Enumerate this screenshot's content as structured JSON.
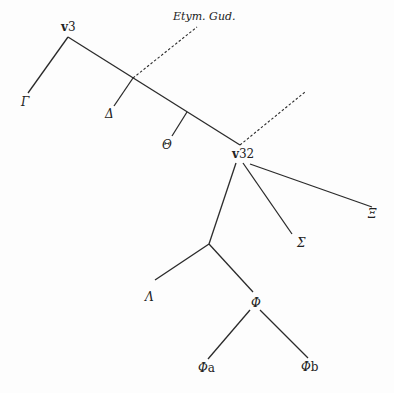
{
  "diagram": {
    "type": "stemma",
    "nodes": [
      {
        "id": "v3",
        "label_prefix": "v",
        "label_suffix": "3"
      },
      {
        "id": "Gamma",
        "label": "Γ"
      },
      {
        "id": "Delta",
        "label": "Δ"
      },
      {
        "id": "Theta",
        "label": "Θ"
      },
      {
        "id": "v32",
        "label_prefix": "v",
        "label_suffix": "32"
      },
      {
        "id": "Xi",
        "label": "Ξ"
      },
      {
        "id": "Sigma",
        "label": "Σ"
      },
      {
        "id": "Lambda",
        "label": "Λ"
      },
      {
        "id": "Phi",
        "label": "Φ"
      },
      {
        "id": "Phia",
        "label_prefix": "Φ",
        "label_suffix": "a"
      },
      {
        "id": "Phib",
        "label_prefix": "Φ",
        "label_suffix": "b"
      },
      {
        "id": "EtymGud",
        "label": "Etym. Gud."
      }
    ],
    "edges": [
      {
        "from": "v3",
        "to": "Gamma",
        "style": "solid"
      },
      {
        "from": "v3",
        "to": "v32",
        "style": "solid"
      },
      {
        "from": "v3-v32 branch",
        "to": "Delta",
        "style": "solid"
      },
      {
        "from": "v3-v32 branch",
        "to": "Theta",
        "style": "solid"
      },
      {
        "from": "v3-v32 branch",
        "to": "EtymGud",
        "style": "dotted"
      },
      {
        "from": "v32",
        "to": "lost source",
        "style": "dotted"
      },
      {
        "from": "v32",
        "to": "Xi",
        "style": "solid"
      },
      {
        "from": "v32",
        "to": "Sigma",
        "style": "solid"
      },
      {
        "from": "v32",
        "to": "hyparchetype",
        "style": "solid"
      },
      {
        "from": "hyparchetype",
        "to": "Lambda",
        "style": "solid"
      },
      {
        "from": "hyparchetype",
        "to": "Phi",
        "style": "solid"
      },
      {
        "from": "Phi",
        "to": "Phia",
        "style": "solid"
      },
      {
        "from": "Phi",
        "to": "Phib",
        "style": "solid"
      }
    ]
  }
}
